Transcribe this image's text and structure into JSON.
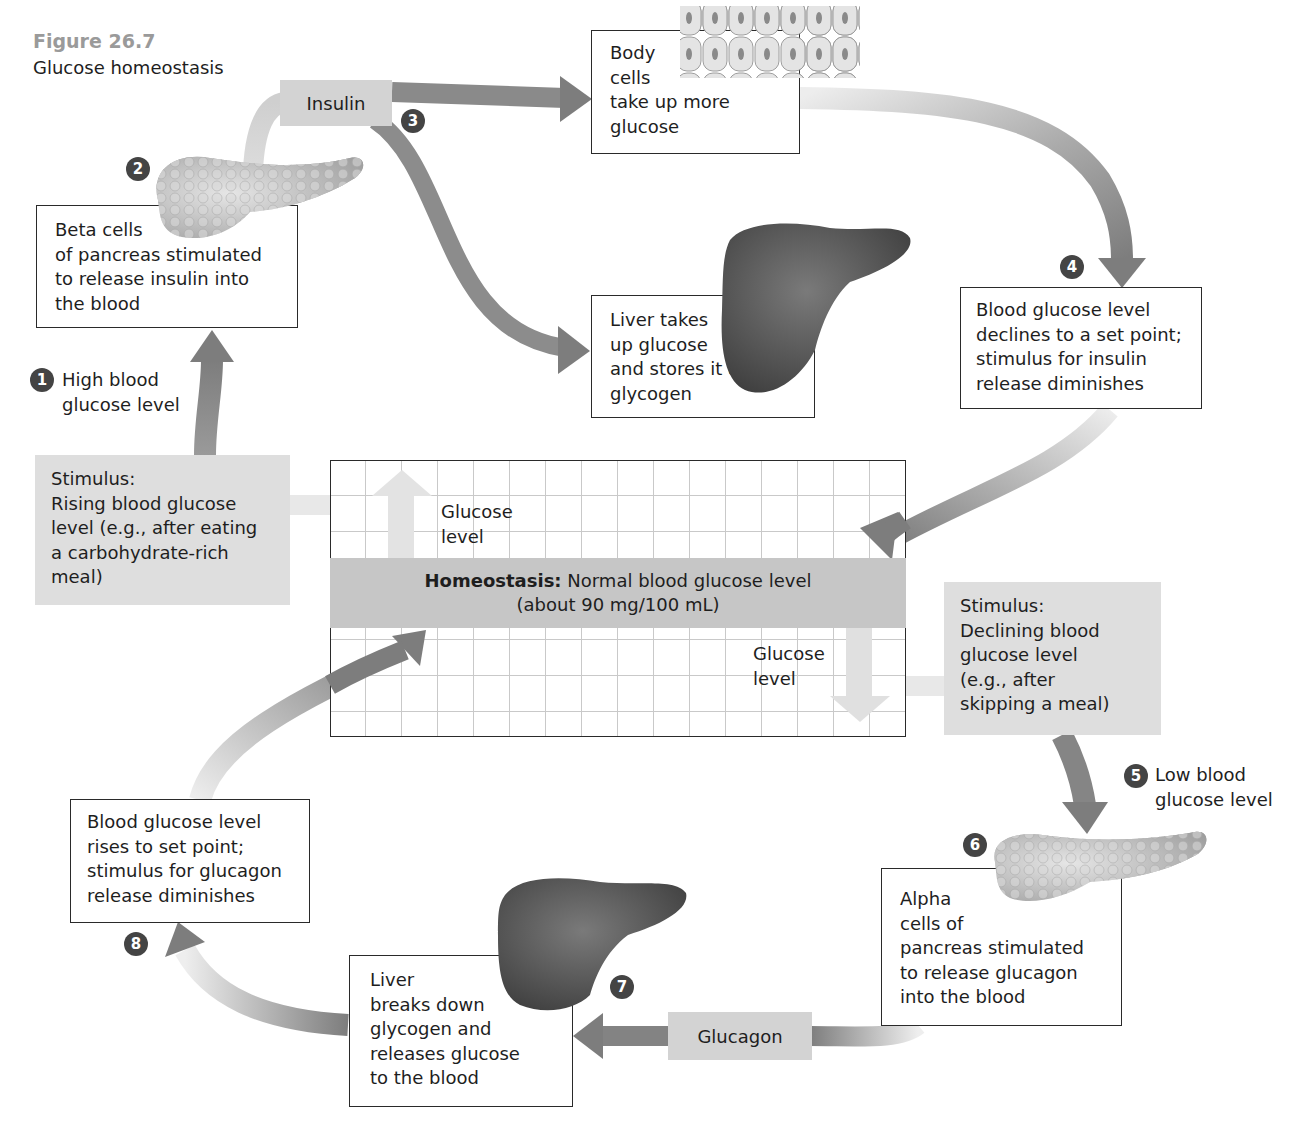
{
  "figure": {
    "number": "Figure 26.7",
    "title": "Glucose homeostasis"
  },
  "homeostasis": {
    "bold_label": "Homeostasis:",
    "line1": "Normal blood glucose level",
    "line2": "(about 90 mg/100 mL)",
    "up_label": "Glucose\nlevel",
    "down_label": "Glucose\nlevel"
  },
  "stimuli": {
    "rising": "Stimulus:\nRising blood glucose\nlevel (e.g., after eating\na carbohydrate-rich\nmeal)",
    "declining": "Stimulus:\nDeclining blood\nglucose level\n(e.g., after\nskipping a meal)"
  },
  "hormones": {
    "insulin": "Insulin",
    "glucagon": "Glucagon"
  },
  "steps": [
    {
      "num": "1",
      "text": "High blood\nglucose level"
    },
    {
      "num": "2",
      "text": "Beta cells\nof pancreas stimulated\nto release insulin into\nthe blood"
    },
    {
      "num": "3",
      "text": "Body\ncells\ntake up more\nglucose",
      "text_b": "Liver takes\nup glucose\nand stores it as\nglycogen"
    },
    {
      "num": "4",
      "text": "Blood glucose level\ndeclines to a set point;\nstimulus for insulin\nrelease diminishes"
    },
    {
      "num": "5",
      "text": "Low blood\nglucose level"
    },
    {
      "num": "6",
      "text": "Alpha\ncells of\npancreas stimulated\nto release glucagon\ninto the blood"
    },
    {
      "num": "7",
      "text": "Liver\nbreaks down\nglycogen and\nreleases glucose\nto the blood"
    },
    {
      "num": "8",
      "text": "Blood glucose level\nrises to set point;\nstimulus for glucagon\nrelease diminishes"
    }
  ],
  "colors": {
    "arrow_dark": "#7d7d7d",
    "arrow_light": "#e4e4e4",
    "stimulus_bg": "#dedede",
    "band_bg": "#c6c6c6",
    "badge_bg": "#444444",
    "figure_number": "#9a9a9a"
  }
}
